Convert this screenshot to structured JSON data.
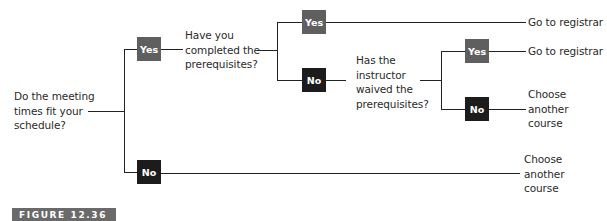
{
  "diagram": {
    "type": "decision-tree",
    "root": {
      "question": "Do the meeting\ntimes fit your\nschedule?"
    },
    "level1": {
      "yes_label": "Yes",
      "no_label": "No",
      "yes_question": "Have you\ncompleted the\nprerequisites?",
      "no_outcome": "Choose\nanother\ncourse"
    },
    "level2": {
      "yes_label": "Yes",
      "no_label": "No",
      "yes_outcome": "Go to registrar",
      "no_question": "Has the\ninstructor\nwaived the\nprerequisites?"
    },
    "level3": {
      "yes_label": "Yes",
      "no_label": "No",
      "yes_outcome": "Go to registrar",
      "no_outcome": "Choose\nanother\ncourse"
    },
    "colors": {
      "yes_box": "#5f5f5f",
      "no_box": "#1c1c1c",
      "lines": "#222222",
      "figure_label_bg": "#6a6a6a"
    }
  },
  "figure_label": "FIGURE 12.36"
}
